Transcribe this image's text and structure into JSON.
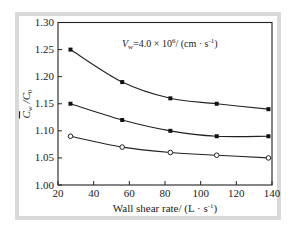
{
  "chart_data": {
    "type": "line",
    "title": "",
    "annotation": "Vw=4.0×10⁶/ (cm · s⁻¹)",
    "xlabel": "Wall shear rate/ (L · s⁻¹)",
    "ylabel": "C̄w / C0",
    "xlim": [
      20,
      140
    ],
    "ylim": [
      1.0,
      1.3
    ],
    "xticks": [
      20,
      40,
      60,
      80,
      100,
      120,
      140
    ],
    "yticks": [
      1.0,
      1.05,
      1.1,
      1.15,
      1.2,
      1.25,
      1.3
    ],
    "grid": false,
    "legend": null,
    "x": [
      27,
      56,
      83,
      109,
      138
    ],
    "series": [
      {
        "name": "series-1",
        "marker": "filled-square",
        "values": [
          1.25,
          1.19,
          1.16,
          1.15,
          1.14
        ]
      },
      {
        "name": "series-2",
        "marker": "filled-square",
        "values": [
          1.15,
          1.12,
          1.1,
          1.09,
          1.09
        ]
      },
      {
        "name": "series-3",
        "marker": "open-circle",
        "values": [
          1.09,
          1.07,
          1.06,
          1.055,
          1.05
        ]
      }
    ]
  },
  "labels": {
    "xlabel": "Wall shear rate/ (L · s",
    "xlabel_sup": "-1",
    "xlabel_end": ")",
    "ylabel_main": "C",
    "ylabel_sub_w": "w",
    "ylabel_slash": " /C",
    "ylabel_sub_0": "0",
    "anno_v": "V",
    "anno_sub": "w",
    "anno_rest": "=4.0 × 10",
    "anno_exp": "6",
    "anno_units": "/ (cm · s",
    "anno_units_sup": "-1",
    "anno_units_end": ")"
  },
  "colors": {
    "line": "#222222",
    "frame": "#d9d9d9",
    "marker_fill": "#111111",
    "open_marker_fill": "#ffffff"
  }
}
